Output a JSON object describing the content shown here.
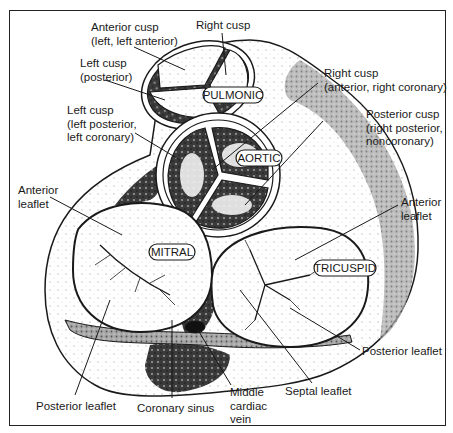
{
  "figure": {
    "colors": {
      "ink": "#1a1a1a",
      "stipple_dark": "#2b2b2b",
      "stipple_mid": "#8a8a8a",
      "stipple_light": "#e6e6e6",
      "background": "#ffffff"
    },
    "valve_tags": {
      "pulmonic": "PULMONIC",
      "aortic": "AORTIC",
      "mitral": "MITRAL",
      "tricuspid": "TRICUSPID"
    },
    "labels": {
      "pulm_right_cusp": "Right cusp",
      "pulm_anterior_cusp": "Anterior cusp\n(left, left anterior)",
      "pulm_left_cusp": "Left cusp\n(posterior)",
      "aortic_left_cusp": "Left cusp\n(left posterior,\nleft coronary)",
      "aortic_right_cusp": "Right cusp\n(anterior, right coronary)",
      "aortic_posterior_cusp": "Posterior cusp\n(right posterior,\nnoncoronary)",
      "mitral_anterior_leaflet": "Anterior\nleaflet",
      "tricuspid_anterior_leaflet": "Anterior\nleaflet",
      "mitral_posterior_leaflet": "Posterior leaflet",
      "coronary_sinus": "Coronary sinus",
      "middle_cardiac_vein": "Middle\ncardiac\nvein",
      "septal_leaflet": "Septal leaflet",
      "tricuspid_posterior_leaflet": "Posterior leaflet"
    }
  }
}
